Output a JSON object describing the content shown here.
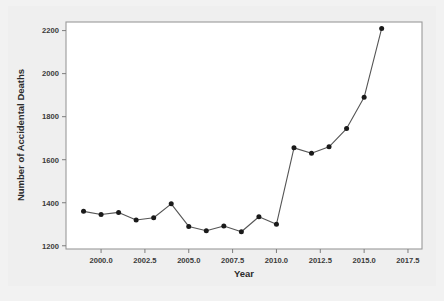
{
  "chart_data": {
    "type": "line",
    "title": "",
    "xlabel": "Year",
    "ylabel": "Number of Accidental Deaths",
    "xlim": [
      1998.0,
      2018.3
    ],
    "ylim": [
      1185,
      2240
    ],
    "grid": false,
    "legend": null,
    "marker": "filled-circle",
    "line_color": "#555555",
    "marker_color": "#1a1a1a",
    "x_ticks": [
      "2000.0",
      "2002.5",
      "2005.0",
      "2007.5",
      "2010.0",
      "2012.5",
      "2015.0",
      "2017.5"
    ],
    "x_tick_values": [
      2000.0,
      2002.5,
      2005.0,
      2007.5,
      2010.0,
      2012.5,
      2015.0,
      2017.5
    ],
    "y_ticks": [
      "1200",
      "1400",
      "1600",
      "1800",
      "2000",
      "2200"
    ],
    "y_tick_values": [
      1200,
      1400,
      1600,
      1800,
      2000,
      2200
    ],
    "x": [
      1999,
      2000,
      2001,
      2002,
      2003,
      2004,
      2005,
      2006,
      2007,
      2008,
      2009,
      2010,
      2011,
      2012,
      2013,
      2014,
      2015,
      2016
    ],
    "values": [
      1360,
      1345,
      1355,
      1320,
      1330,
      1395,
      1290,
      1270,
      1292,
      1265,
      1335,
      1300,
      1655,
      1630,
      1660,
      1745,
      1890,
      2210
    ],
    "series": [
      {
        "name": "Accidental Deaths",
        "values": [
          1360,
          1345,
          1355,
          1320,
          1330,
          1395,
          1290,
          1270,
          1292,
          1265,
          1335,
          1300,
          1655,
          1630,
          1660,
          1745,
          1890,
          2210
        ]
      }
    ]
  },
  "axes": {
    "x_title": "Year",
    "y_title": "Number of Accidental Deaths"
  }
}
